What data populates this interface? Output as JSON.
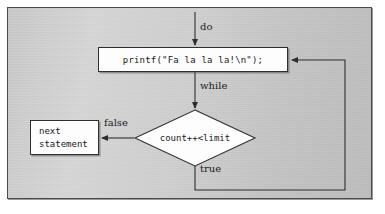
{
  "figure": {
    "kind": "flowchart",
    "background_color": "#cccccc",
    "frame_border_color": "#4a4a4a",
    "node_fill_color": "#fdfdfd",
    "line_color": "#2e2e2e"
  },
  "nodes": {
    "printf": {
      "shape": "rectangle",
      "text": "printf(\"Fa la la la!\\n\");"
    },
    "condition": {
      "shape": "diamond",
      "text": "count++<limit"
    },
    "next_statement": {
      "shape": "rectangle",
      "line1": "next",
      "line2": "statement"
    }
  },
  "edges": {
    "entry": {
      "label": "do",
      "from": "top",
      "to": "printf"
    },
    "printf_to_condition": {
      "label": "while",
      "from": "printf",
      "to": "condition"
    },
    "condition_false": {
      "label": "false",
      "from": "condition",
      "to": "next_statement"
    },
    "condition_true": {
      "label": "true",
      "from": "condition",
      "to": "printf"
    }
  }
}
